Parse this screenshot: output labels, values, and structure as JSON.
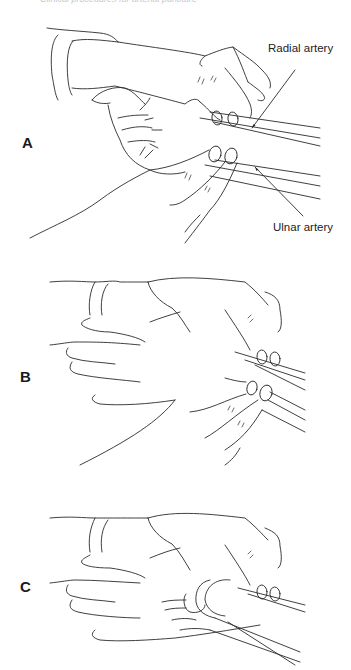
{
  "running_head": "Clinical procedures for arterial puncture",
  "figure": {
    "panels": [
      {
        "id": "A",
        "label": "A",
        "callouts": [
          {
            "text": "Radial artery",
            "target": "upper artery line"
          },
          {
            "text": "Ulnar artery",
            "target": "lower artery line"
          }
        ]
      },
      {
        "id": "B",
        "label": "B",
        "callouts": []
      },
      {
        "id": "C",
        "label": "C",
        "callouts": []
      }
    ],
    "colors": {
      "line": "#2a2a2a",
      "background": "#ffffff",
      "text": "#222222"
    }
  }
}
